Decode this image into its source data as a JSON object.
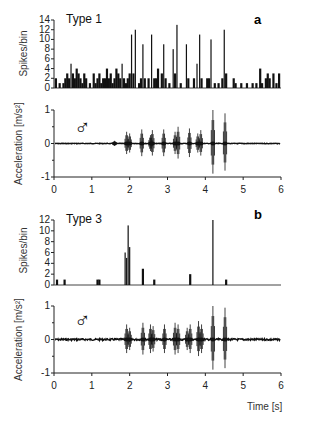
{
  "chart_data": [
    {
      "panel": "a",
      "type": "bar",
      "title": "Type 1",
      "ylabel": "Spikes/bin",
      "yticks": [
        0,
        2,
        4,
        6,
        8,
        10,
        12,
        14
      ],
      "ylim": [
        0,
        14
      ],
      "xlim": [
        0,
        6
      ],
      "spikes": [
        {
          "x": 0.05,
          "h": 2
        },
        {
          "x": 0.15,
          "h": 1
        },
        {
          "x": 0.25,
          "h": 1
        },
        {
          "x": 0.3,
          "h": 2
        },
        {
          "x": 0.35,
          "h": 3
        },
        {
          "x": 0.4,
          "h": 2
        },
        {
          "x": 0.45,
          "h": 5
        },
        {
          "x": 0.5,
          "h": 3
        },
        {
          "x": 0.55,
          "h": 2
        },
        {
          "x": 0.6,
          "h": 4
        },
        {
          "x": 0.65,
          "h": 3
        },
        {
          "x": 0.7,
          "h": 2
        },
        {
          "x": 0.75,
          "h": 1
        },
        {
          "x": 0.8,
          "h": 3
        },
        {
          "x": 0.85,
          "h": 2
        },
        {
          "x": 0.95,
          "h": 1
        },
        {
          "x": 1.05,
          "h": 3
        },
        {
          "x": 1.1,
          "h": 1
        },
        {
          "x": 1.15,
          "h": 2
        },
        {
          "x": 1.2,
          "h": 3
        },
        {
          "x": 1.25,
          "h": 1
        },
        {
          "x": 1.3,
          "h": 2
        },
        {
          "x": 1.35,
          "h": 2
        },
        {
          "x": 1.4,
          "h": 4
        },
        {
          "x": 1.45,
          "h": 2
        },
        {
          "x": 1.5,
          "h": 3
        },
        {
          "x": 1.55,
          "h": 1
        },
        {
          "x": 1.6,
          "h": 2
        },
        {
          "x": 1.65,
          "h": 4
        },
        {
          "x": 1.7,
          "h": 3
        },
        {
          "x": 1.75,
          "h": 2
        },
        {
          "x": 1.8,
          "h": 5
        },
        {
          "x": 1.85,
          "h": 2
        },
        {
          "x": 1.9,
          "h": 1
        },
        {
          "x": 1.95,
          "h": 2
        },
        {
          "x": 2.0,
          "h": 3
        },
        {
          "x": 2.05,
          "h": 11
        },
        {
          "x": 2.1,
          "h": 3
        },
        {
          "x": 2.15,
          "h": 12
        },
        {
          "x": 2.25,
          "h": 1
        },
        {
          "x": 2.3,
          "h": 2
        },
        {
          "x": 2.35,
          "h": 9
        },
        {
          "x": 2.4,
          "h": 2
        },
        {
          "x": 2.5,
          "h": 2
        },
        {
          "x": 2.58,
          "h": 11
        },
        {
          "x": 2.65,
          "h": 2
        },
        {
          "x": 2.7,
          "h": 2
        },
        {
          "x": 2.75,
          "h": 4
        },
        {
          "x": 2.85,
          "h": 3
        },
        {
          "x": 2.9,
          "h": 9
        },
        {
          "x": 2.95,
          "h": 2
        },
        {
          "x": 3.05,
          "h": 1
        },
        {
          "x": 3.15,
          "h": 8
        },
        {
          "x": 3.2,
          "h": 3
        },
        {
          "x": 3.25,
          "h": 13
        },
        {
          "x": 3.35,
          "h": 1
        },
        {
          "x": 3.5,
          "h": 9
        },
        {
          "x": 3.55,
          "h": 2
        },
        {
          "x": 3.7,
          "h": 2
        },
        {
          "x": 3.78,
          "h": 5
        },
        {
          "x": 3.85,
          "h": 11
        },
        {
          "x": 3.9,
          "h": 2
        },
        {
          "x": 4.05,
          "h": 2
        },
        {
          "x": 4.1,
          "h": 2
        },
        {
          "x": 4.15,
          "h": 10
        },
        {
          "x": 4.25,
          "h": 1
        },
        {
          "x": 4.35,
          "h": 1
        },
        {
          "x": 4.45,
          "h": 2
        },
        {
          "x": 4.5,
          "h": 12
        },
        {
          "x": 4.55,
          "h": 3
        },
        {
          "x": 4.75,
          "h": 2
        },
        {
          "x": 4.8,
          "h": 1
        },
        {
          "x": 4.95,
          "h": 1
        },
        {
          "x": 5.1,
          "h": 1
        },
        {
          "x": 5.25,
          "h": 1
        },
        {
          "x": 5.35,
          "h": 1
        },
        {
          "x": 5.45,
          "h": 4
        },
        {
          "x": 5.5,
          "h": 1
        },
        {
          "x": 5.6,
          "h": 2
        },
        {
          "x": 5.65,
          "h": 3
        },
        {
          "x": 5.7,
          "h": 2
        },
        {
          "x": 5.8,
          "h": 3
        },
        {
          "x": 5.88,
          "h": 1
        },
        {
          "x": 5.95,
          "h": 3
        }
      ]
    },
    {
      "panel": "a",
      "type": "line",
      "ylabel": "Acceleration [m/s²]",
      "yticks": [
        -1,
        0,
        1
      ],
      "ylim": [
        -1,
        1
      ],
      "xticks": [
        0,
        1,
        2,
        3,
        4,
        5,
        6
      ],
      "xlim": [
        0,
        6
      ],
      "bursts": [
        {
          "x": 1.6,
          "amp": 0.08
        },
        {
          "x": 1.92,
          "amp": 0.35
        },
        {
          "x": 2.0,
          "amp": 0.3
        },
        {
          "x": 2.32,
          "amp": 0.42
        },
        {
          "x": 2.6,
          "amp": 0.4
        },
        {
          "x": 2.55,
          "amp": 0.25
        },
        {
          "x": 2.9,
          "amp": 0.42
        },
        {
          "x": 3.2,
          "amp": 0.35
        },
        {
          "x": 3.28,
          "amp": 0.5
        },
        {
          "x": 3.58,
          "amp": 0.45
        },
        {
          "x": 3.8,
          "amp": 0.3
        },
        {
          "x": 3.88,
          "amp": 0.4
        },
        {
          "x": 4.2,
          "amp": 1.0
        },
        {
          "x": 4.52,
          "amp": 0.9
        }
      ],
      "noise": 0.01
    },
    {
      "panel": "b",
      "type": "bar",
      "title": "Type 3",
      "ylabel": "Spikes/bin",
      "yticks": [
        0,
        2,
        4,
        6,
        8,
        10,
        12
      ],
      "ylim": [
        0,
        12
      ],
      "xlim": [
        0,
        6
      ],
      "spikes": [
        {
          "x": 0.08,
          "h": 1
        },
        {
          "x": 0.28,
          "h": 1
        },
        {
          "x": 1.15,
          "h": 1
        },
        {
          "x": 1.2,
          "h": 1
        },
        {
          "x": 1.88,
          "h": 6
        },
        {
          "x": 1.92,
          "h": 5
        },
        {
          "x": 1.96,
          "h": 11
        },
        {
          "x": 2.0,
          "h": 7
        },
        {
          "x": 2.35,
          "h": 3
        },
        {
          "x": 2.65,
          "h": 1
        },
        {
          "x": 3.6,
          "h": 2
        },
        {
          "x": 4.2,
          "h": 12
        },
        {
          "x": 4.55,
          "h": 1
        }
      ]
    },
    {
      "panel": "b",
      "type": "line",
      "ylabel": "Acceleration [m/s²]",
      "yticks": [
        -1,
        0,
        1
      ],
      "ylim": [
        -1,
        1
      ],
      "xticks": [
        0,
        1,
        2,
        3,
        4,
        5,
        6
      ],
      "xlim": [
        0,
        6
      ],
      "xlabel": "Time [s]",
      "bursts": [
        {
          "x": 1.92,
          "amp": 0.45
        },
        {
          "x": 2.0,
          "amp": 0.35
        },
        {
          "x": 2.35,
          "amp": 0.5
        },
        {
          "x": 2.55,
          "amp": 0.45
        },
        {
          "x": 2.62,
          "amp": 0.4
        },
        {
          "x": 2.92,
          "amp": 0.45
        },
        {
          "x": 3.2,
          "amp": 0.5
        },
        {
          "x": 3.28,
          "amp": 0.45
        },
        {
          "x": 3.52,
          "amp": 0.35
        },
        {
          "x": 3.6,
          "amp": 0.45
        },
        {
          "x": 3.82,
          "amp": 0.55
        },
        {
          "x": 3.9,
          "amp": 0.45
        },
        {
          "x": 4.2,
          "amp": 1.0
        },
        {
          "x": 4.52,
          "amp": 0.95
        }
      ],
      "noise": 0.03
    }
  ],
  "labels": {
    "panel_a_title": "Type 1",
    "panel_a_letter": "a",
    "panel_b_title": "Type 3",
    "panel_b_letter": "b",
    "spikes_ylabel": "Spikes/bin",
    "accel_ylabel": "Acceleration [m/s²]",
    "male_symbol": "♂",
    "xlabel": "Time [s]",
    "x_ticks": [
      "0",
      "1",
      "2",
      "3",
      "4",
      "5",
      "6"
    ],
    "spikes_a_ticks": [
      "14",
      "12",
      "10",
      "8",
      "6",
      "4",
      "2",
      "0"
    ],
    "spikes_b_ticks": [
      "12",
      "10",
      "8",
      "6",
      "4",
      "2",
      "0"
    ],
    "accel_ticks": [
      "1",
      "0",
      "-1"
    ]
  }
}
